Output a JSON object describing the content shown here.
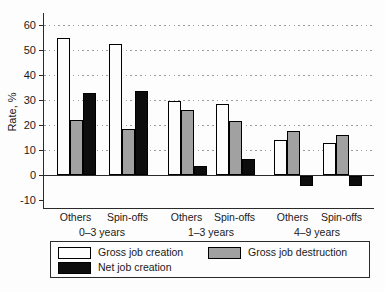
{
  "chart_data": {
    "type": "bar",
    "title": "",
    "ylabel": "Rate, %",
    "ylim": [
      -13,
      64
    ],
    "yticks": [
      60,
      50,
      40,
      30,
      20,
      10,
      0,
      -10
    ],
    "gridline_values": [
      60,
      50,
      40,
      30,
      20,
      10
    ],
    "grid": "dotted horizontal",
    "legend_position": "bottom",
    "group_labels": [
      "Others",
      "Spin-offs",
      "Others",
      "Spin-offs",
      "Others",
      "Spin-offs"
    ],
    "age_group_labels": [
      "0–3 years",
      "1–3 years",
      "4–9 years"
    ],
    "categories": [
      "Others (0–3 years)",
      "Spin-offs (0–3 years)",
      "Others (1–3 years)",
      "Spin-offs (1–3 years)",
      "Others (4–9 years)",
      "Spin-offs (4–9 years)"
    ],
    "series": [
      {
        "name": "Gross job creation",
        "color": "#fdfdfd",
        "values": [
          55,
          52.5,
          29.5,
          28.5,
          14,
          13
        ]
      },
      {
        "name": "Gross job destruction",
        "color": "#a1a1a1",
        "values": [
          22,
          18.5,
          26,
          21.5,
          17.5,
          16
        ]
      },
      {
        "name": "Net job creation",
        "color": "#0d0d0d",
        "values": [
          33,
          33.5,
          3.5,
          6.5,
          -4,
          -4
        ]
      }
    ]
  },
  "legend": {
    "items": [
      {
        "label": "Gross job creation",
        "swatch_color": "#fdfdfd"
      },
      {
        "label": "Gross job destruction",
        "swatch_color": "#a1a1a1"
      },
      {
        "label": "Net job creation",
        "swatch_color": "#0d0d0d"
      }
    ]
  },
  "colors": {
    "axis": "#2a2a2a",
    "grid_dots": "#9c9c9c",
    "text": "#1a1a1a",
    "background": "#fdfdfd",
    "bar_border": "#000000"
  }
}
